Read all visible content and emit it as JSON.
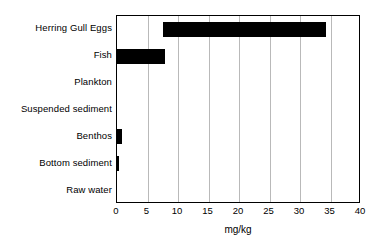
{
  "chart_data": {
    "type": "bar",
    "orientation": "horizontal",
    "bar_style": "floating-range",
    "title": "",
    "subtitle": "",
    "xlabel": "mg/kg",
    "ylabel": "",
    "xlim": [
      0,
      40
    ],
    "xticks": [
      0,
      5,
      10,
      15,
      20,
      25,
      30,
      35,
      40
    ],
    "xtick_labels": [
      "0",
      "5",
      "10",
      "15",
      "20",
      "25",
      "30",
      "35",
      "40"
    ],
    "grid": "vertical",
    "legend": "none",
    "bar_color": "#000000",
    "grid_color": "#b9b9b9",
    "axis_color": "#000000",
    "background": "#ffffff",
    "categories": [
      "Herring Gull Eggs",
      "Fish",
      "Plankton",
      "Suspended sediment",
      "Benthos",
      "Bottom sediment",
      "Raw water"
    ],
    "ranges": [
      {
        "category": "Herring Gull Eggs",
        "start": 7.6,
        "end": 34.2
      },
      {
        "category": "Fish",
        "start": 0.0,
        "end": 7.9
      },
      {
        "category": "Plankton",
        "start": 0.0,
        "end": 0.0
      },
      {
        "category": "Suspended sediment",
        "start": 0.0,
        "end": 0.0
      },
      {
        "category": "Benthos",
        "start": 0.0,
        "end": 0.85
      },
      {
        "category": "Bottom sediment",
        "start": 0.0,
        "end": 0.3
      },
      {
        "category": "Raw water",
        "start": 0.0,
        "end": 0.0
      }
    ],
    "values": [
      26.6,
      7.9,
      0.0,
      0.0,
      0.85,
      0.3,
      0.0
    ]
  }
}
